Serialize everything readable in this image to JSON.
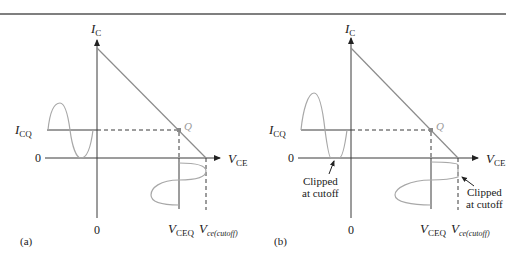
{
  "figure": {
    "panels": [
      {
        "id": "a",
        "caption": "(a)",
        "y_axis_label": "I",
        "y_axis_sub": "C",
        "x_axis_label": "V",
        "x_axis_sub": "CE",
        "icq_label": "I",
        "icq_sub": "CQ",
        "zero_y": "0",
        "zero_x": "0",
        "q_label": "Q",
        "vceq_label": "V",
        "vceq_sub": "CEQ",
        "vcutoff_label": "V",
        "vcutoff_sub": "ce(cutoff)",
        "annotations": []
      },
      {
        "id": "b",
        "caption": "(b)",
        "y_axis_label": "I",
        "y_axis_sub": "C",
        "x_axis_label": "V",
        "x_axis_sub": "CE",
        "icq_label": "I",
        "icq_sub": "CQ",
        "zero_y": "0",
        "zero_x": "0",
        "q_label": "Q",
        "vceq_label": "V",
        "vceq_sub": "CEQ",
        "vcutoff_label": "V",
        "vcutoff_sub": "ce(cutoff)",
        "annotations": [
          {
            "line1": "Clipped",
            "line2": "at cutoff",
            "target": "input current trough"
          },
          {
            "line1": "Clipped",
            "line2": "at cutoff",
            "target": "output voltage peak"
          }
        ]
      }
    ],
    "colors": {
      "axis": "#3a3a3a",
      "load_line": "#8c8c8c",
      "signal": "#a8a8a8",
      "rule": "#555555"
    }
  }
}
